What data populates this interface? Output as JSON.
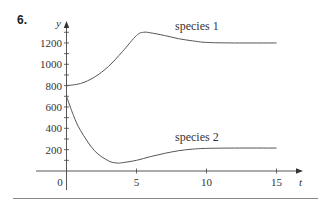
{
  "problem_number": "6.",
  "chart_data": {
    "type": "line",
    "title": "",
    "xlabel": "t",
    "ylabel": "y",
    "xlim": [
      0,
      15
    ],
    "ylim": [
      0,
      1300
    ],
    "grid": false,
    "legend": "inline labels",
    "x_ticks": [
      0,
      5,
      10,
      15
    ],
    "x_tick_labels": [
      "0",
      "5",
      "10",
      "15"
    ],
    "y_ticks": [
      200,
      400,
      600,
      800,
      1000,
      1200
    ],
    "y_tick_labels": [
      "200",
      "400",
      "600",
      "800",
      "1000",
      "1200"
    ],
    "series": [
      {
        "name": "species 1",
        "x": [
          0,
          1,
          2,
          3,
          4,
          5,
          5.5,
          6,
          7,
          8,
          9,
          10,
          12,
          15
        ],
        "values": [
          800,
          820,
          880,
          980,
          1120,
          1270,
          1300,
          1295,
          1270,
          1240,
          1220,
          1205,
          1200,
          1200
        ]
      },
      {
        "name": "species 2",
        "x": [
          0,
          0.5,
          1,
          2,
          3,
          3.6,
          4,
          5,
          6,
          7,
          8,
          9,
          10,
          12,
          15
        ],
        "values": [
          700,
          520,
          380,
          190,
          95,
          75,
          78,
          100,
          135,
          165,
          190,
          205,
          212,
          215,
          215
        ]
      }
    ],
    "annotations": [
      {
        "text": "species 1",
        "near": [
          8,
          1320
        ]
      },
      {
        "text": "species 2",
        "near": [
          8,
          300
        ]
      }
    ]
  }
}
